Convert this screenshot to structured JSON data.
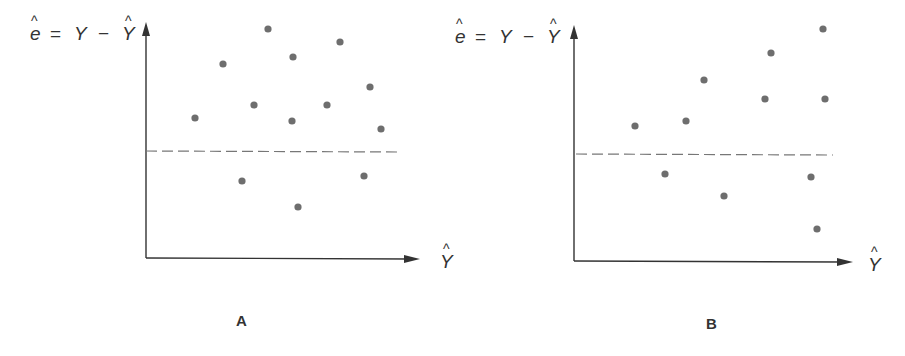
{
  "figure": {
    "colors": {
      "axis": "#333333",
      "point": "#6e6e6e",
      "dashed": "#777777",
      "text": "#333333"
    },
    "panels": [
      {
        "id": "A",
        "label": "A",
        "y_axis_label": {
          "e": "e",
          "eq": "=",
          "Y": "Y",
          "minus": "−",
          "Yhat": "Y"
        },
        "x_axis_label": "Y",
        "axis": {
          "origin": [
            146,
            258
          ],
          "y_top": 22,
          "x_end": 420
        },
        "zero_line": {
          "y": 151,
          "x1": 146,
          "x2": 398
        },
        "label_pos": {
          "x": 236,
          "y": 326
        },
        "y_label_pos": {
          "x": 30,
          "y": 40
        },
        "x_label_pos": {
          "x": 440,
          "y": 268
        }
      },
      {
        "id": "B",
        "label": "B",
        "y_axis_label": {
          "e": "e",
          "eq": "=",
          "Y": "Y",
          "minus": "−",
          "Yhat": "Y"
        },
        "x_axis_label": "Y",
        "axis": {
          "origin": [
            574,
            261
          ],
          "y_top": 25,
          "x_end": 853
        },
        "zero_line": {
          "y": 154,
          "x1": 576,
          "x2": 833
        },
        "label_pos": {
          "x": 706,
          "y": 329
        },
        "y_label_pos": {
          "x": 455,
          "y": 43
        },
        "x_label_pos": {
          "x": 868,
          "y": 271
        }
      }
    ]
  },
  "chart_data": [
    {
      "type": "scatter",
      "title": "A",
      "xlabel": "Ŷ",
      "ylabel": "ê = Y − Ŷ",
      "grid": false,
      "reference_line": {
        "y": 0,
        "style": "dashed"
      },
      "description": "Residuals scattered randomly with constant spread around zero (homoscedastic)",
      "points": [
        [
          195,
          118
        ],
        [
          223,
          64
        ],
        [
          268,
          29
        ],
        [
          254,
          105
        ],
        [
          293,
          57
        ],
        [
          292,
          121
        ],
        [
          340,
          42
        ],
        [
          327,
          105
        ],
        [
          370,
          87
        ],
        [
          381,
          129
        ],
        [
          242,
          181
        ],
        [
          364,
          176
        ],
        [
          298,
          207
        ]
      ]
    },
    {
      "type": "scatter",
      "title": "B",
      "xlabel": "Ŷ",
      "ylabel": "ê = Y − Ŷ",
      "grid": false,
      "reference_line": {
        "y": 0,
        "style": "dashed"
      },
      "description": "Residual spread increasing with fitted values (heteroscedastic, funnel shape)",
      "points": [
        [
          635,
          126
        ],
        [
          686,
          121
        ],
        [
          704,
          80
        ],
        [
          665,
          174
        ],
        [
          724,
          196
        ],
        [
          765,
          99
        ],
        [
          771,
          53
        ],
        [
          823,
          29
        ],
        [
          825,
          99
        ],
        [
          811,
          177
        ],
        [
          817,
          229
        ]
      ]
    }
  ]
}
